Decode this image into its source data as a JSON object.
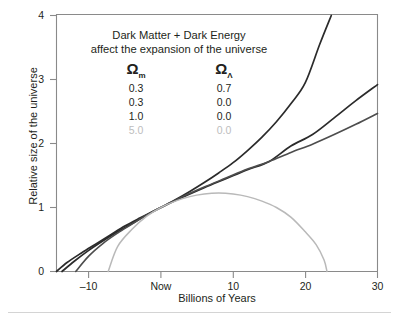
{
  "chart_data": {
    "type": "line",
    "title": "",
    "annotation": [
      "Dark Matter + Dark Energy",
      "affect the expansion of the universe"
    ],
    "xlabel": "Billions of Years",
    "ylabel": "Relative size of the universe",
    "xlim": [
      -14.9,
      30
    ],
    "ylim": [
      0,
      4
    ],
    "grid": false,
    "legend_position": "inside-upper-left",
    "legend_headers": [
      "Ω",
      "Ω"
    ],
    "legend_header_subscripts": [
      "m",
      "Λ"
    ],
    "xticks": [
      {
        "value": -10,
        "label": "–10"
      },
      {
        "value": 0,
        "label": "Now"
      },
      {
        "value": 10,
        "label": "10"
      },
      {
        "value": 20,
        "label": "20"
      },
      {
        "value": 30,
        "label": "30"
      }
    ],
    "yticks": [
      {
        "value": 0,
        "label": "0"
      },
      {
        "value": 1,
        "label": "1"
      },
      {
        "value": 2,
        "label": "2"
      },
      {
        "value": 3,
        "label": "3"
      },
      {
        "value": 4,
        "label": "4"
      }
    ],
    "series": [
      {
        "name": "Om 0.3, OL 0.7",
        "omega_m": "0.3",
        "omega_lambda": "0.7",
        "color": "#2b2b2b",
        "faded": false,
        "x": [
          -13.7,
          -12,
          -10,
          -8,
          -6,
          -4,
          -2,
          0,
          2,
          4,
          6,
          8,
          10,
          12,
          14,
          16,
          18,
          20,
          22,
          23.6
        ],
        "y": [
          0,
          0.16,
          0.33,
          0.48,
          0.62,
          0.75,
          0.88,
          1.0,
          1.12,
          1.25,
          1.39,
          1.54,
          1.7,
          1.89,
          2.1,
          2.34,
          2.62,
          2.95,
          3.55,
          4.0
        ]
      },
      {
        "name": "Om 0.3, OL 0.0",
        "omega_m": "0.3",
        "omega_lambda": "0.0",
        "color": "#2b2b2b",
        "faded": false,
        "x": [
          -14.8,
          -13,
          -11,
          -9,
          -7,
          -5,
          -3,
          0,
          3,
          6,
          9,
          12,
          15,
          18,
          21,
          24,
          27,
          30
        ],
        "y": [
          0,
          0.14,
          0.29,
          0.43,
          0.57,
          0.71,
          0.83,
          1.0,
          1.16,
          1.31,
          1.45,
          1.59,
          1.72,
          1.96,
          2.14,
          2.4,
          2.67,
          2.92
        ]
      },
      {
        "name": "Om 1.0, OL 0.0",
        "omega_m": "1.0",
        "omega_lambda": "0.0",
        "color": "#4d4d4d",
        "faded": false,
        "x": [
          -11.8,
          -10,
          -8,
          -6,
          -4,
          -2,
          0,
          3,
          6,
          9,
          12,
          15,
          18,
          21,
          24,
          27,
          30
        ],
        "y": [
          0,
          0.24,
          0.44,
          0.6,
          0.74,
          0.88,
          1.0,
          1.17,
          1.32,
          1.46,
          1.6,
          1.72,
          1.86,
          1.99,
          2.14,
          2.3,
          2.47
        ]
      },
      {
        "name": "Om 5.0, OL 0.0",
        "omega_m": "5.0",
        "omega_lambda": "0.0",
        "color": "#b9b9b9",
        "faded": true,
        "x": [
          -7.3,
          -6,
          -4,
          -2,
          0,
          2,
          4,
          6,
          8,
          10,
          12,
          14,
          16,
          18,
          20,
          21.5,
          22.6,
          23.0
        ],
        "y": [
          0,
          0.39,
          0.66,
          0.86,
          1.0,
          1.1,
          1.17,
          1.21,
          1.225,
          1.21,
          1.17,
          1.1,
          1.0,
          0.85,
          0.62,
          0.42,
          0.18,
          0.0
        ]
      }
    ]
  }
}
